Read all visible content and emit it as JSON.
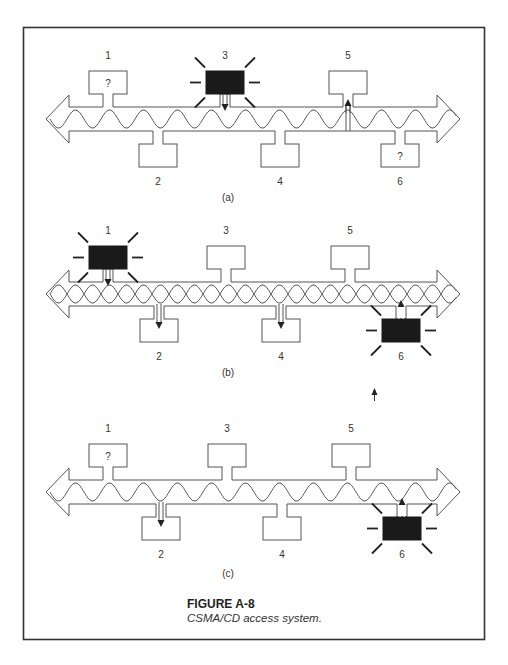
{
  "top_clipped_text": "",
  "figure": {
    "number": "FIGURE A-8",
    "caption": "CSMA/CD access system."
  },
  "panels": [
    {
      "id": "a",
      "label": "(a)",
      "bus_center_y": 119,
      "wave": "single",
      "stations": [
        {
          "num": "1",
          "side": "top",
          "x": 108,
          "state": "listening",
          "mark": "?"
        },
        {
          "num": "2",
          "side": "bottom",
          "x": 158,
          "state": "idle",
          "mark": ""
        },
        {
          "num": "3",
          "side": "top",
          "x": 225,
          "state": "transmitting",
          "mark": "",
          "arrow": "down"
        },
        {
          "num": "4",
          "side": "bottom",
          "x": 280,
          "state": "idle",
          "mark": ""
        },
        {
          "num": "5",
          "side": "top",
          "x": 348,
          "state": "receiving",
          "mark": "",
          "arrow": "up"
        },
        {
          "num": "6",
          "side": "bottom",
          "x": 400,
          "state": "listening",
          "mark": "?"
        }
      ]
    },
    {
      "id": "b",
      "label": "(b)",
      "bus_center_y": 294,
      "wave": "collision",
      "stations": [
        {
          "num": "1",
          "side": "top",
          "x": 108,
          "state": "transmitting",
          "mark": "",
          "arrow": "down"
        },
        {
          "num": "2",
          "side": "bottom",
          "x": 159,
          "state": "receiving",
          "mark": "",
          "arrow": "down"
        },
        {
          "num": "3",
          "side": "top",
          "x": 226,
          "state": "idle",
          "mark": ""
        },
        {
          "num": "4",
          "side": "bottom",
          "x": 281,
          "state": "receiving",
          "mark": "",
          "arrow": "down"
        },
        {
          "num": "5",
          "side": "top",
          "x": 350,
          "state": "idle",
          "mark": ""
        },
        {
          "num": "6",
          "side": "bottom",
          "x": 401,
          "state": "transmitting",
          "mark": "",
          "arrow": "up"
        }
      ]
    },
    {
      "id": "c",
      "label": "(c)",
      "bus_center_y": 492,
      "wave": "single",
      "stations": [
        {
          "num": "1",
          "side": "top",
          "x": 108,
          "state": "listening",
          "mark": "?"
        },
        {
          "num": "2",
          "side": "bottom",
          "x": 161,
          "state": "receiving",
          "mark": "",
          "arrow": "down"
        },
        {
          "num": "3",
          "side": "top",
          "x": 227,
          "state": "idle",
          "mark": ""
        },
        {
          "num": "4",
          "side": "bottom",
          "x": 282,
          "state": "idle",
          "mark": ""
        },
        {
          "num": "5",
          "side": "top",
          "x": 351,
          "state": "idle",
          "mark": ""
        },
        {
          "num": "6",
          "side": "bottom",
          "x": 402,
          "state": "transmitting",
          "mark": "",
          "arrow": "up"
        }
      ]
    }
  ],
  "colors": {
    "line": "#555555",
    "frame": "#333333",
    "transmitting_fill": "#1a1a1a",
    "background": "#ffffff"
  }
}
